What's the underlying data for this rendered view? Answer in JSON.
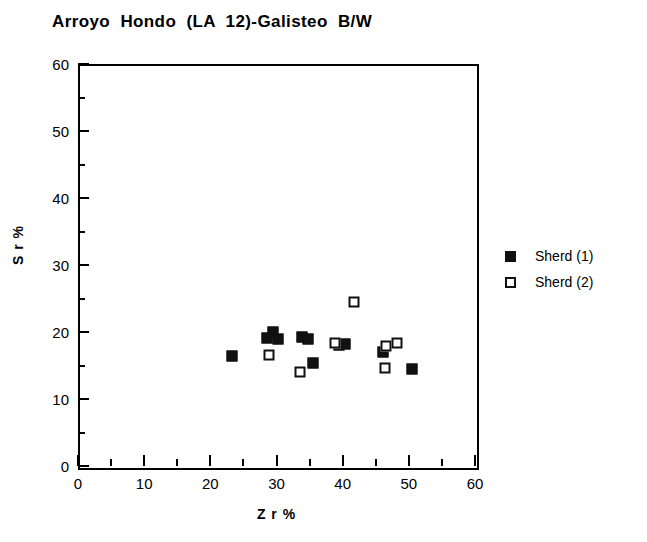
{
  "chart_data": {
    "type": "scatter",
    "title": "Arroyo  Hondo  (LA  12)-Galisteo  B/W",
    "xlabel": "Z r %",
    "ylabel": "S r %",
    "xlim": [
      0,
      60
    ],
    "ylim": [
      0,
      60
    ],
    "xticks": [
      0,
      10,
      20,
      30,
      40,
      50,
      60
    ],
    "yticks": [
      0,
      10,
      20,
      30,
      40,
      50,
      60
    ],
    "xminor_ticks": [
      5,
      15,
      25,
      35,
      45,
      55
    ],
    "yminor_ticks": [
      5,
      15,
      25,
      35,
      45,
      55
    ],
    "grid": false,
    "legend_position": "right",
    "series": [
      {
        "name": "Sherd (1)",
        "marker": "filled-square",
        "color": "#111111",
        "points": [
          {
            "x": 23.3,
            "y": 16.4
          },
          {
            "x": 28.5,
            "y": 19.1
          },
          {
            "x": 29.5,
            "y": 20.0
          },
          {
            "x": 30.2,
            "y": 19.0
          },
          {
            "x": 33.8,
            "y": 19.3
          },
          {
            "x": 34.8,
            "y": 19.0
          },
          {
            "x": 35.5,
            "y": 15.4
          },
          {
            "x": 39.4,
            "y": 18.1
          },
          {
            "x": 40.3,
            "y": 18.2
          },
          {
            "x": 46.1,
            "y": 17.0
          },
          {
            "x": 50.5,
            "y": 14.5
          }
        ]
      },
      {
        "name": "Sherd (2)",
        "marker": "open-square",
        "color": "#111111",
        "points": [
          {
            "x": 28.9,
            "y": 16.6
          },
          {
            "x": 33.5,
            "y": 14.0
          },
          {
            "x": 38.8,
            "y": 18.3
          },
          {
            "x": 41.7,
            "y": 24.5
          },
          {
            "x": 46.4,
            "y": 14.7
          },
          {
            "x": 46.5,
            "y": 17.9
          },
          {
            "x": 48.2,
            "y": 18.3
          }
        ]
      }
    ]
  },
  "legend": {
    "entries": [
      {
        "label": "Sherd (1)",
        "marker": "filled-square"
      },
      {
        "label": "Sherd (2)",
        "marker": "open-square"
      }
    ]
  }
}
